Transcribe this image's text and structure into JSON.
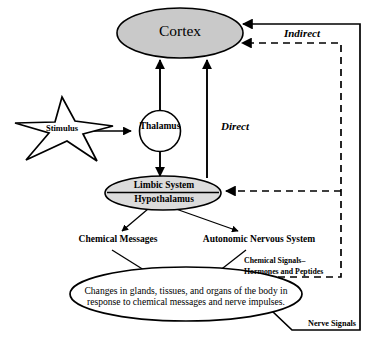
{
  "diagram": {
    "colors": {
      "stroke": "#000000",
      "cortex_fill": "#c9c9c9",
      "limbic_fill": "#dcdcdc",
      "star_fill": "#ffffff",
      "effect_fill": "#ffffff",
      "background": "#ffffff"
    },
    "nodes": {
      "cortex": {
        "label": "Cortex",
        "shape": "ellipse",
        "fill": "#c9c9c9"
      },
      "thalamus": {
        "label": "Thalamus",
        "shape": "circle",
        "fill": "#ffffff"
      },
      "limbic_system": {
        "label": "Limbic System",
        "shape": "ellipse",
        "fill": "#dcdcdc"
      },
      "hypothalamus": {
        "label": "Hypothalamus",
        "shape": "ellipse",
        "fill": "#dcdcdc"
      },
      "stimulus": {
        "label": "Stimulus",
        "shape": "star",
        "fill": "#ffffff"
      },
      "effect": {
        "label": "Changes in glands, tissues, and organs of the body in response to chemical messages and nerve impulses.",
        "shape": "ellipse",
        "fill": "#ffffff"
      }
    },
    "branch_labels": {
      "chemical_messages": "Chemical Messages",
      "autonomic_nervous_system": "Autonomic Nervous System"
    },
    "pathway_labels": {
      "direct": "Direct",
      "indirect": "Indirect",
      "chemical_signals": "Chemical Signals–\nHormones and Peptides",
      "chemical_signals_line1": "Chemical Signals–",
      "chemical_signals_line2": "Hormones and Peptides",
      "nerve_signals": "Nerve Signals"
    },
    "edges": [
      {
        "from": "stimulus",
        "to": "thalamus",
        "style": "solid",
        "arrow": "single"
      },
      {
        "from": "thalamus",
        "to": "cortex",
        "style": "solid",
        "arrow": "single"
      },
      {
        "from": "thalamus",
        "to": "hypothalamus",
        "style": "solid",
        "arrow": "single"
      },
      {
        "from": "limbic_system",
        "to": "cortex",
        "style": "solid",
        "arrow": "single",
        "label": "Direct"
      },
      {
        "from": "hypothalamus",
        "to": "chemical_messages",
        "style": "solid",
        "arrow": "single"
      },
      {
        "from": "hypothalamus",
        "to": "autonomic_nervous_system",
        "style": "solid",
        "arrow": "single"
      },
      {
        "from": "chemical_messages",
        "to": "effect",
        "style": "solid",
        "arrow": "single"
      },
      {
        "from": "autonomic_nervous_system",
        "to": "effect",
        "style": "solid",
        "arrow": "single"
      },
      {
        "from": "effect",
        "to": "cortex",
        "style": "dashed",
        "arrow": "single",
        "label": "Indirect"
      },
      {
        "from": "effect",
        "to": "limbic_system",
        "style": "dashed",
        "arrow": "single",
        "label": "Chemical Signals–Hormones and Peptides"
      },
      {
        "from": "effect",
        "to": "cortex",
        "style": "solid",
        "arrow": "single",
        "label": "Nerve Signals"
      }
    ]
  }
}
